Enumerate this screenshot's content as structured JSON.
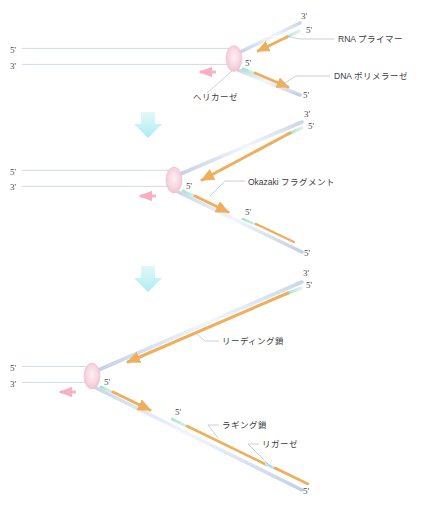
{
  "figure": {
    "language": "ja",
    "colors": {
      "parent_strand": "#c3cfe4",
      "parent_strand_core": "#e8eef8",
      "rna_primer": "#9fe0cf",
      "dna_polymerase_arrow": "#eeae5b",
      "helicase": "#f3c8d4",
      "helicase_core": "#fbe4ec",
      "fork_move_arrow": "#f7b6c4",
      "step_arrow": "#bdf0f2",
      "leader_line": "#9aa3ad",
      "text": "#3a3a3a"
    }
  },
  "labels": {
    "rna_primer": "RNA プライマー",
    "dna_polymerase": "DNA ポリメラーゼ",
    "helicase": "ヘリカーゼ",
    "okazaki_fragment": "Okazaki フラグメント",
    "leading_strand": "リーディング鎖",
    "lagging_strand": "ラギング鎖",
    "ligase": "リガーゼ"
  },
  "end_labels": {
    "five_prime": "5'",
    "three_prime": "3'"
  },
  "panels": [
    {
      "id": "panel-1",
      "stage": 1,
      "end_markers": [
        {
          "name": "parent-top-left",
          "text": "5'",
          "x": 10,
          "y": 53
        },
        {
          "name": "parent-bottom-left",
          "text": "3'",
          "x": 10,
          "y": 69
        },
        {
          "name": "fork-center",
          "text": "5'",
          "x": 245,
          "y": 66
        },
        {
          "name": "upper-template-end",
          "text": "3'",
          "x": 301,
          "y": 19
        },
        {
          "name": "upper-new-end",
          "text": "5'",
          "x": 306,
          "y": 33
        },
        {
          "name": "lower-template-end",
          "text": "5'",
          "x": 303,
          "y": 98
        }
      ],
      "annotations": [
        {
          "name": "rna-primer-callout",
          "label": "RNA プライマー",
          "x": 338,
          "y": 42
        },
        {
          "name": "dna-polymerase-callout",
          "label": "DNA ポリメラーゼ",
          "x": 334,
          "y": 79
        },
        {
          "name": "helicase-callout",
          "label": "ヘリカーゼ",
          "x": 193,
          "y": 100
        }
      ]
    },
    {
      "id": "panel-2",
      "stage": 2,
      "end_markers": [
        {
          "name": "parent-top-left",
          "text": "5'",
          "x": 10,
          "y": 175
        },
        {
          "name": "parent-bottom-left",
          "text": "3'",
          "x": 10,
          "y": 190
        },
        {
          "name": "fork-center",
          "text": "5'",
          "x": 186,
          "y": 189
        },
        {
          "name": "upper-template-end",
          "text": "3'",
          "x": 304,
          "y": 117
        },
        {
          "name": "upper-new-end",
          "text": "5'",
          "x": 308,
          "y": 129
        },
        {
          "name": "lagging-primer-end",
          "text": "5'",
          "x": 245,
          "y": 215
        },
        {
          "name": "lower-template-end",
          "text": "5'",
          "x": 304,
          "y": 256
        }
      ],
      "annotations": [
        {
          "name": "okazaki-fragment-callout",
          "label": "Okazaki フラグメント",
          "x": 248,
          "y": 185
        }
      ]
    },
    {
      "id": "panel-3",
      "stage": 3,
      "end_markers": [
        {
          "name": "parent-top-left",
          "text": "5'",
          "x": 10,
          "y": 371
        },
        {
          "name": "parent-bottom-left",
          "text": "3'",
          "x": 10,
          "y": 387
        },
        {
          "name": "fork-center",
          "text": "5'",
          "x": 104,
          "y": 385
        },
        {
          "name": "upper-template-end",
          "text": "3'",
          "x": 303,
          "y": 276
        },
        {
          "name": "upper-new-end",
          "text": "5'",
          "x": 306,
          "y": 288
        },
        {
          "name": "lagging-primer-end",
          "text": "5'",
          "x": 175,
          "y": 415
        },
        {
          "name": "lower-template-end",
          "text": "5'",
          "x": 303,
          "y": 494
        }
      ],
      "annotations": [
        {
          "name": "leading-strand-callout",
          "label": "リーディング鎖",
          "x": 222,
          "y": 344
        },
        {
          "name": "lagging-strand-callout",
          "label": "ラギング鎖",
          "x": 222,
          "y": 428
        },
        {
          "name": "ligase-callout",
          "label": "リガーゼ",
          "x": 262,
          "y": 447
        }
      ]
    }
  ],
  "step_arrows": [
    {
      "name": "step-arrow-1-to-2",
      "x": 148,
      "y": 122
    },
    {
      "name": "step-arrow-2-to-3",
      "x": 148,
      "y": 276
    }
  ]
}
